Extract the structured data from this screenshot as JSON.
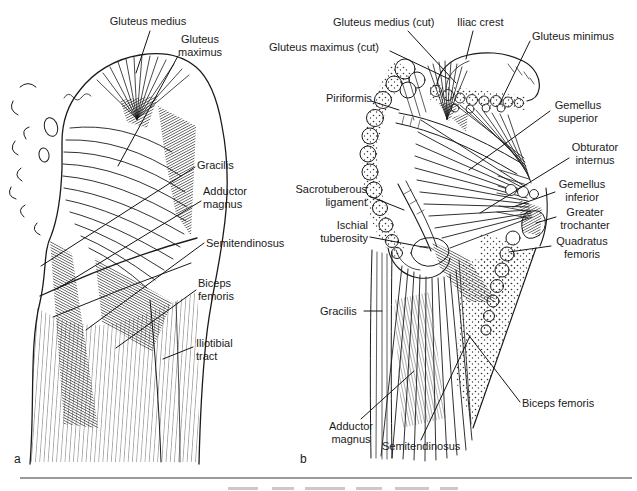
{
  "figure": {
    "ink_color": "#1a1a1a",
    "rule_color": "#9a9a9a",
    "panel_a": {
      "letter": "a",
      "labels": {
        "gluteus_medius": "Gluteus medius",
        "gluteus_maximus": "Gluteus\nmaximus",
        "gracilis": "Gracilis",
        "adductor_magnus": "Adductor\nmagnus",
        "semitendinosus": "Semitendinosus",
        "biceps_femoris": "Biceps\nfemoris",
        "iliotibial_tract": "Iliotibial\ntract"
      }
    },
    "panel_b": {
      "letter": "b",
      "labels": {
        "gluteus_medius_cut": "Gluteus medius (cut)",
        "iliac_crest": "Iliac crest",
        "gluteus_maximus_cut": "Gluteus maximus (cut)",
        "gluteus_minimus": "Gluteus minimus",
        "piriformis": "Piriformis",
        "gemellus_superior": "Gemellus\nsuperior",
        "obturator_internus": "Obturator\ninternus",
        "gemellus_inferior": "Gemellus\ninferior",
        "greater_trochanter": "Greater\ntrochanter",
        "quadratus_femoris": "Quadratus\nfemoris",
        "sacrotuberous_ligament": "Sacrotuberous\nligament",
        "ischial_tuberosity": "Ischial\ntuberosity",
        "gracilis": "Gracilis",
        "adductor_magnus": "Adductor\nmagnus",
        "semitendinosus": "Semitendinosus",
        "biceps_femoris": "Biceps femoris"
      }
    }
  }
}
